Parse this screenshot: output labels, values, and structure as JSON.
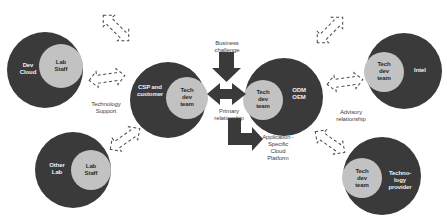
{
  "colors": {
    "outer_circle": "#3a3a3a",
    "inner_circle": "#c2c2c2",
    "arrow": "#3a3a3a",
    "background": "#ffffff"
  },
  "nodes": [
    {
      "id": "dev-cloud",
      "outer_label": "Dev\nCloud",
      "inner_label": "Lab\nStaff"
    },
    {
      "id": "other-lab",
      "outer_label": "Other\nLab",
      "inner_label": "Lab\nStaff"
    },
    {
      "id": "csp",
      "outer_label": "CSP and\ncustomer",
      "inner_label": "Tech\ndev\nteam"
    },
    {
      "id": "odm",
      "outer_label": "ODM\nOEM",
      "inner_label": "Tech\ndev\nteam"
    },
    {
      "id": "intel",
      "outer_label": "Intel",
      "inner_label": "Tech\ndev\nteam"
    },
    {
      "id": "tech-provider",
      "outer_label": "Techno-\nlogy\nprovider",
      "inner_label": "Tech\ndev\nteam"
    }
  ],
  "edge_labels": {
    "technology_support": "Technology\nSupport",
    "business_challenge": "Business\nchallenge",
    "primary_relationship": "Primary\nrelationship",
    "application": "Application -\nSpecific\nCloud\nPlatform",
    "advisory_relationship": "Advisory\nrelationship"
  }
}
